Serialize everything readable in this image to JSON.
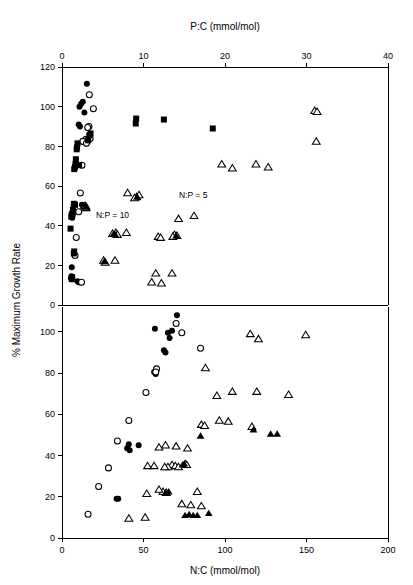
{
  "chart_data": {
    "type": "scatter",
    "title": "",
    "ylabel": "% Maximum Growth Rate",
    "grid": false,
    "legend_position": "none",
    "panels": [
      {
        "id": "top",
        "xlabel": "P:C (mmol/mol)",
        "xlabel_position": "top",
        "xlim": [
          0,
          40
        ],
        "xticks": [
          0,
          10,
          20,
          30,
          40
        ],
        "xticklabels": [
          "0",
          "10",
          "20",
          "30",
          "40"
        ],
        "ylim": [
          0,
          120
        ],
        "yticks": [
          0,
          20,
          40,
          60,
          80,
          100,
          120
        ],
        "yticklabels": [
          "0",
          "20",
          "40",
          "60",
          "80",
          "100",
          "120"
        ],
        "annotations": [
          {
            "text": "N:P = 10",
            "x": 6.2,
            "y": 44
          },
          {
            "text": "N:P = 5",
            "x": 16.1,
            "y": 54
          }
        ],
        "series": [
          {
            "name": "filled-circle",
            "marker": "filled-circle",
            "points": [
              [
                3.05,
                111.5
              ],
              [
                2.55,
                102.5
              ],
              [
                2.35,
                101.5
              ],
              [
                2.15,
                100.0
              ],
              [
                2.75,
                97.0
              ],
              [
                2.05,
                91.0
              ],
              [
                2.2,
                90.0
              ],
              [
                2.45,
                50.5
              ],
              [
                2.6,
                49.5
              ],
              [
                1.55,
                51.0
              ],
              [
                1.35,
                46.5
              ],
              [
                1.3,
                45.0
              ],
              [
                1.25,
                44.0
              ],
              [
                1.2,
                19.0
              ],
              [
                1.15,
                14.5
              ],
              [
                1.1,
                13.5
              ],
              [
                1.9,
                12.0
              ],
              [
                2.05,
                11.5
              ]
            ]
          },
          {
            "name": "open-circle",
            "marker": "open-circle",
            "points": [
              [
                3.35,
                106.0
              ],
              [
                3.85,
                99.0
              ],
              [
                3.3,
                90.0
              ],
              [
                3.15,
                89.5
              ],
              [
                2.95,
                83.5
              ],
              [
                2.55,
                82.5
              ],
              [
                2.45,
                70.5
              ],
              [
                2.25,
                56.5
              ],
              [
                2.05,
                47.0
              ],
              [
                1.75,
                34.0
              ],
              [
                1.6,
                25.0
              ],
              [
                3.0,
                81.5
              ],
              [
                3.45,
                84.0
              ],
              [
                2.4,
                11.5
              ]
            ]
          },
          {
            "name": "filled-square",
            "marker": "filled-square",
            "points": [
              [
                12.5,
                93.5
              ],
              [
                9.1,
                94.0
              ],
              [
                9.05,
                91.5
              ],
              [
                18.5,
                89.0
              ],
              [
                3.5,
                86.5
              ],
              [
                3.35,
                85.5
              ],
              [
                3.2,
                83.0
              ],
              [
                1.9,
                81.5
              ],
              [
                1.85,
                79.5
              ],
              [
                1.8,
                78.5
              ],
              [
                1.7,
                73.5
              ],
              [
                1.65,
                71.0
              ],
              [
                2.1,
                70.5
              ],
              [
                1.6,
                69.5
              ],
              [
                1.5,
                68.5
              ],
              [
                1.45,
                51.0
              ],
              [
                1.6,
                50.5
              ],
              [
                1.35,
                48.0
              ],
              [
                1.25,
                46.0
              ],
              [
                1.2,
                45.5
              ],
              [
                1.15,
                44.5
              ],
              [
                1.05,
                38.5
              ],
              [
                1.5,
                27.0
              ],
              [
                1.45,
                26.0
              ],
              [
                1.25,
                14.0
              ],
              [
                1.2,
                13.0
              ]
            ]
          },
          {
            "name": "open-triangle",
            "marker": "open-triangle",
            "points": [
              [
                31.0,
                98.0
              ],
              [
                31.3,
                97.5
              ],
              [
                31.2,
                82.5
              ],
              [
                19.6,
                71.0
              ],
              [
                23.8,
                71.0
              ],
              [
                25.3,
                69.5
              ],
              [
                20.9,
                69.0
              ],
              [
                8.05,
                56.5
              ],
              [
                9.45,
                55.5
              ],
              [
                9.15,
                54.5
              ],
              [
                8.9,
                54.0
              ],
              [
                2.8,
                50.0
              ],
              [
                2.95,
                49.0
              ],
              [
                16.2,
                45.0
              ],
              [
                14.3,
                43.5
              ],
              [
                6.6,
                36.5
              ],
              [
                6.2,
                36.0
              ],
              [
                7.9,
                36.5
              ],
              [
                6.8,
                35.5
              ],
              [
                13.8,
                35.5
              ],
              [
                14.1,
                35.0
              ],
              [
                13.6,
                34.5
              ],
              [
                11.8,
                34.5
              ],
              [
                12.1,
                34.0
              ],
              [
                5.1,
                22.5
              ],
              [
                5.3,
                21.5
              ],
              [
                6.5,
                22.5
              ],
              [
                11.5,
                16.0
              ],
              [
                13.5,
                16.0
              ],
              [
                11.0,
                11.5
              ],
              [
                12.2,
                11.0
              ]
            ]
          },
          {
            "name": "filled-triangle",
            "marker": "filled-triangle",
            "points": [
              [
                2.9,
                50.5
              ],
              [
                3.05,
                49.5
              ],
              [
                6.35,
                36.0
              ],
              [
                6.55,
                35.5
              ],
              [
                9.2,
                54.5
              ],
              [
                14.0,
                35.0
              ],
              [
                5.2,
                22.0
              ]
            ]
          }
        ]
      },
      {
        "id": "bottom",
        "xlabel": "N:C (mmol/mol)",
        "xlabel_position": "bottom",
        "xlim": [
          0,
          200
        ],
        "xticks": [
          0,
          50,
          100,
          150,
          200
        ],
        "xticklabels": [
          "0",
          "50",
          "100",
          "150",
          "200"
        ],
        "ylim": [
          0,
          112
        ],
        "yticks": [
          0,
          20,
          40,
          60,
          80,
          100
        ],
        "yticklabels": [
          "0",
          "20",
          "40",
          "60",
          "80",
          "100"
        ],
        "annotations": [],
        "series": [
          {
            "name": "filled-circle",
            "marker": "filled-circle",
            "points": [
              [
                70.5,
                108.0
              ],
              [
                57.0,
                101.5
              ],
              [
                67.5,
                100.5
              ],
              [
                65.0,
                99.5
              ],
              [
                66.0,
                97.0
              ],
              [
                62.5,
                91.0
              ],
              [
                63.5,
                90.0
              ],
              [
                56.5,
                80.5
              ],
              [
                57.5,
                79.5
              ],
              [
                41.0,
                45.5
              ],
              [
                47.0,
                45.0
              ],
              [
                40.0,
                43.5
              ],
              [
                41.5,
                42.5
              ],
              [
                33.5,
                19.0
              ],
              [
                34.5,
                19.0
              ]
            ]
          },
          {
            "name": "open-circle",
            "marker": "open-circle",
            "points": [
              [
                70.0,
                104.0
              ],
              [
                73.5,
                99.5
              ],
              [
                85.0,
                92.0
              ],
              [
                58.0,
                82.0
              ],
              [
                51.5,
                70.5
              ],
              [
                41.0,
                57.0
              ],
              [
                34.0,
                47.0
              ],
              [
                28.5,
                34.0
              ],
              [
                22.5,
                25.0
              ],
              [
                16.0,
                11.5
              ],
              [
                57.5,
                80.5
              ]
            ]
          },
          {
            "name": "open-triangle",
            "marker": "open-triangle",
            "points": [
              [
                115.5,
                99.0
              ],
              [
                149.5,
                98.5
              ],
              [
                120.5,
                96.5
              ],
              [
                88.0,
                82.5
              ],
              [
                104.5,
                71.0
              ],
              [
                119.5,
                71.0
              ],
              [
                139.0,
                69.5
              ],
              [
                95.0,
                69.0
              ],
              [
                96.5,
                57.0
              ],
              [
                102.0,
                56.5
              ],
              [
                85.5,
                55.0
              ],
              [
                87.5,
                54.5
              ],
              [
                116.5,
                54.0
              ],
              [
                70.0,
                44.5
              ],
              [
                63.5,
                45.0
              ],
              [
                77.0,
                43.5
              ],
              [
                59.5,
                44.0
              ],
              [
                75.5,
                36.0
              ],
              [
                76.5,
                35.5
              ],
              [
                67.5,
                35.5
              ],
              [
                69.5,
                35.0
              ],
              [
                65.0,
                34.5
              ],
              [
                71.5,
                34.5
              ],
              [
                63.0,
                34.5
              ],
              [
                56.5,
                35.0
              ],
              [
                52.5,
                35.0
              ],
              [
                62.0,
                22.5
              ],
              [
                59.5,
                23.5
              ],
              [
                64.0,
                22.0
              ],
              [
                52.0,
                21.5
              ],
              [
                83.0,
                22.5
              ],
              [
                73.5,
                16.5
              ],
              [
                79.0,
                16.0
              ],
              [
                85.5,
                15.5
              ],
              [
                41.0,
                9.5
              ],
              [
                51.0,
                10.0
              ]
            ]
          },
          {
            "name": "filled-triangle",
            "marker": "filled-triangle",
            "points": [
              [
                128.0,
                50.5
              ],
              [
                132.0,
                50.5
              ],
              [
                117.5,
                52.5
              ],
              [
                85.0,
                49.5
              ],
              [
                78.0,
                11.5
              ],
              [
                80.5,
                11.0
              ],
              [
                83.0,
                11.0
              ],
              [
                90.0,
                12.0
              ],
              [
                75.5,
                11.0
              ],
              [
                65.5,
                22.5
              ],
              [
                63.5,
                22.0
              ],
              [
                74.0,
                35.5
              ],
              [
                75.0,
                36.0
              ]
            ]
          }
        ]
      }
    ]
  },
  "axis_titles": {
    "top": "P:C (mmol/mol)",
    "bottom": "N:C (mmol/mol)",
    "left": "% Maximum Growth Rate"
  }
}
